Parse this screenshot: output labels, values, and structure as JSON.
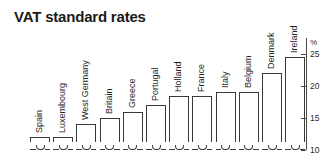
{
  "header": {
    "title": "VAT standard rates"
  },
  "axis": {
    "unit_label": "%",
    "tick_labels": [
      "25",
      "20",
      "15",
      "10"
    ]
  },
  "chart_data": {
    "type": "bar",
    "title": "VAT standard rates",
    "xlabel": "",
    "ylabel": "%",
    "ylim": [
      10,
      26
    ],
    "yticks": [
      10,
      15,
      20,
      25
    ],
    "grid": false,
    "legend": null,
    "orientation": "vertical",
    "categories": [
      "Spain",
      "Luxembourg",
      "West Germany",
      "Britain",
      "Greece",
      "Portugal",
      "Holland",
      "France",
      "Italy",
      "Belgium",
      "Denmark",
      "Ireland"
    ],
    "values": [
      12,
      12,
      14,
      15,
      16,
      17,
      18.5,
      18.5,
      19,
      19,
      22,
      24.5
    ],
    "value_unit": "%"
  }
}
